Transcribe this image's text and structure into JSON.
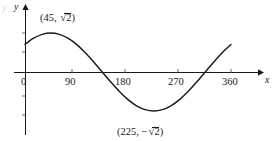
{
  "figure": {
    "type": "sine-curve-graph",
    "axes": {
      "x_label": "x",
      "y_label": "y",
      "x_ticks": [
        {
          "value": 0,
          "label": "0",
          "px": 25
        },
        {
          "value": 90,
          "label": "90",
          "px": 72
        },
        {
          "value": 180,
          "label": "180",
          "px": 125
        },
        {
          "value": 270,
          "label": "270",
          "px": 178
        },
        {
          "value": 360,
          "label": "360",
          "px": 231
        }
      ],
      "y_ticks_unlabeled": 4,
      "origin_px": {
        "x": 25,
        "y": 72
      }
    },
    "annotations": [
      {
        "name": "maximum-label",
        "text_open": "(45, ",
        "radicand": "2",
        "text_close": ")",
        "x_px": 40,
        "y_px": 12
      },
      {
        "name": "minimum-label",
        "text_open": "(225, −",
        "radicand": "2",
        "text_close": ")",
        "x_px": 117,
        "y_px": 126
      }
    ]
  },
  "chart_data": {
    "type": "line",
    "title": "",
    "xlabel": "x",
    "ylabel": "y",
    "xlim": [
      -12,
      372
    ],
    "ylim": [
      -1.9,
      1.9
    ],
    "grid": false,
    "legend": null,
    "function": "y = sqrt(2) * sin(x + 45)",
    "annotations": [
      {
        "label": "(45, √2)",
        "x": 45,
        "y": 1.414
      },
      {
        "label": "(225, −√2)",
        "x": 225,
        "y": -1.414
      }
    ],
    "x": [
      0,
      15,
      30,
      45,
      60,
      75,
      90,
      105,
      120,
      135,
      150,
      165,
      180,
      195,
      210,
      225,
      240,
      255,
      270,
      285,
      300,
      315,
      330,
      345,
      360
    ],
    "y": [
      1.0,
      1.225,
      1.366,
      1.414,
      1.366,
      1.225,
      1.0,
      0.707,
      0.366,
      0.0,
      -0.366,
      -0.707,
      -1.0,
      -1.225,
      -1.366,
      -1.414,
      -1.366,
      -1.225,
      -1.0,
      -0.707,
      -0.366,
      0.0,
      0.366,
      0.707,
      1.0
    ],
    "x_intercepts": [
      135,
      315
    ],
    "maximum": {
      "x": 45,
      "y": 1.414
    },
    "minimum": {
      "x": 225,
      "y": -1.414
    },
    "xtick_labels": [
      "0",
      "90",
      "180",
      "270",
      "360"
    ],
    "xtick_values": [
      0,
      90,
      180,
      270,
      360
    ]
  }
}
